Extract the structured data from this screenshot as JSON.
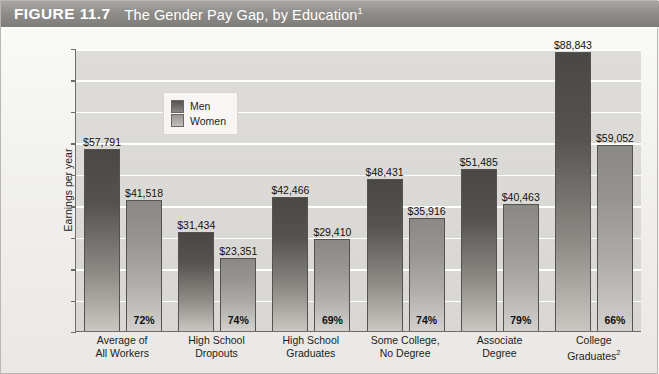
{
  "figure": {
    "label": "FIGURE 11.7",
    "title": "The Gender Pay Gap, by Education",
    "title_footnote": "1"
  },
  "legend": {
    "men_label": "Men",
    "women_label": "Women"
  },
  "axis": {
    "ylabel": "Earnings per year",
    "yticks": [
      "$90,000",
      "$80,000",
      "$70,000",
      "$60,000",
      "$50,000",
      "$40,000",
      "$30,000",
      "$20,000",
      "$10,000",
      "0"
    ]
  },
  "categories": [
    {
      "line1": "Average of",
      "line2": "All Workers",
      "footnote": ""
    },
    {
      "line1": "High School",
      "line2": "Dropouts",
      "footnote": ""
    },
    {
      "line1": "High School",
      "line2": "Graduates",
      "footnote": ""
    },
    {
      "line1": "Some College,",
      "line2": "No Degree",
      "footnote": ""
    },
    {
      "line1": "Associate",
      "line2": "Degree",
      "footnote": ""
    },
    {
      "line1": "College",
      "line2": "Graduates",
      "footnote": "2"
    }
  ],
  "bars": [
    {
      "men_value": "$57,791",
      "women_value": "$41,518",
      "pct": "72%"
    },
    {
      "men_value": "$31,434",
      "women_value": "$23,351",
      "pct": "74%"
    },
    {
      "men_value": "$42,466",
      "women_value": "$29,410",
      "pct": "69%"
    },
    {
      "men_value": "$48,431",
      "women_value": "$35,916",
      "pct": "74%"
    },
    {
      "men_value": "$51,485",
      "women_value": "$40,463",
      "pct": "79%"
    },
    {
      "men_value": "$88,843",
      "women_value": "$59,052",
      "pct": "66%"
    }
  ],
  "colors": {
    "men": "#55534f",
    "women": "#aeaca8",
    "plot_background": "#dcdad6",
    "title_bar": "#8e8c88"
  },
  "chart_data": {
    "type": "bar",
    "title": "The Gender Pay Gap, by Education",
    "xlabel": "",
    "ylabel": "Earnings per year",
    "ylim": [
      0,
      90000
    ],
    "ytick_values": [
      0,
      10000,
      20000,
      30000,
      40000,
      50000,
      60000,
      70000,
      80000,
      90000
    ],
    "grid": true,
    "legend_position": "upper-left-inside",
    "categories": [
      "Average of All Workers",
      "High School Dropouts",
      "High School Graduates",
      "Some College, No Degree",
      "Associate Degree",
      "College Graduates"
    ],
    "series": [
      {
        "name": "Men",
        "values": [
          57791,
          31434,
          42466,
          48431,
          51485,
          88843
        ]
      },
      {
        "name": "Women",
        "values": [
          41518,
          23351,
          29410,
          35916,
          40463,
          59052
        ]
      }
    ],
    "annotations": {
      "women_to_men_ratio_percent": [
        "72%",
        "74%",
        "69%",
        "74%",
        "79%",
        "66%"
      ]
    }
  }
}
